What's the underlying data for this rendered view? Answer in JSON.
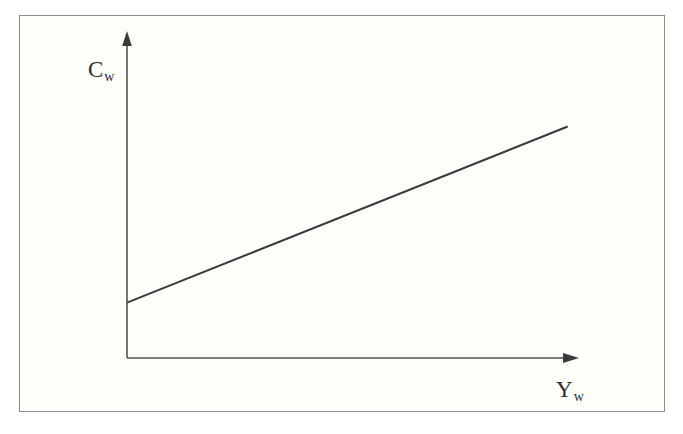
{
  "figure": {
    "background_color": "#fdfdfa",
    "border_color": "#8e8e86",
    "ink_color": "#3a3a3a"
  },
  "axes": {
    "y": {
      "label_main": "C",
      "label_sub": "w",
      "label_full": "Cw",
      "arrow": "up-arrow-icon"
    },
    "x": {
      "label_main": "Y",
      "label_sub": "w",
      "label_full": "Yw",
      "arrow": "right-arrow-icon"
    }
  },
  "chart_data": {
    "type": "line",
    "title": "",
    "subtitle": "",
    "xlabel": "Yw",
    "ylabel": "Cw",
    "xlim": [
      0,
      100
    ],
    "ylim": [
      0,
      100
    ],
    "grid": false,
    "legend": null,
    "axis_ticks": {
      "x": [],
      "y": []
    },
    "annotations": [],
    "series": [
      {
        "name": "Cw",
        "x": [
          0,
          92
        ],
        "values": [
          17,
          71
        ],
        "intercept": 17,
        "slope": 0.587,
        "description": "Upward sloping straight line beginning on the vertical axis above the origin"
      }
    ]
  }
}
